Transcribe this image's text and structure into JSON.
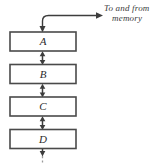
{
  "figure": {
    "width": 153,
    "height": 165,
    "background_color": "#ffffff",
    "line_color": "#3d3d3d",
    "box_stroke_color": "#4a4a4a",
    "box_fill_color": "#ffffff",
    "faded_color": "#9a9a9a"
  },
  "annotation": {
    "line1": "To and from",
    "line2": "memory",
    "full_text": "To and from memory",
    "style": "italic-handwritten"
  },
  "boxes": [
    {
      "label": "A",
      "name": "register-a"
    },
    {
      "label": "B",
      "name": "register-b"
    },
    {
      "label": "C",
      "name": "register-c"
    },
    {
      "label": "D",
      "name": "register-d"
    }
  ],
  "connectors": [
    {
      "name": "a-to-b",
      "type": "double-headed-arrow"
    },
    {
      "name": "b-to-c",
      "type": "double-headed-arrow"
    },
    {
      "name": "c-to-d",
      "type": "double-headed-arrow"
    }
  ],
  "memory_link": {
    "name": "memory-bus",
    "type": "curved-bidirectional",
    "arrow_into_box": "down",
    "arrow_to_memory": "right"
  },
  "bottom_continuation": {
    "name": "continuation",
    "type": "dashed-down-arrow"
  }
}
